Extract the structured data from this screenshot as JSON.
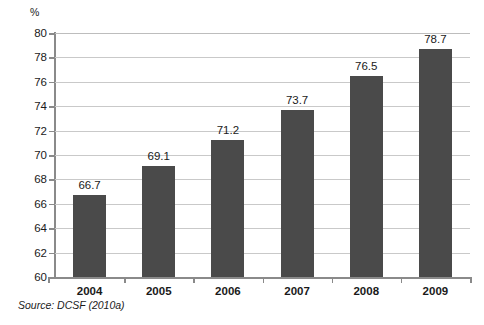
{
  "chart_data": {
    "type": "bar",
    "title": "",
    "subtitle": "",
    "xlabel": "",
    "ylabel": "%",
    "categories": [
      "2004",
      "2005",
      "2006",
      "2007",
      "2008",
      "2009"
    ],
    "values": [
      66.7,
      69.1,
      71.2,
      73.7,
      76.5,
      78.7
    ],
    "data_labels": [
      "66.7",
      "69.1",
      "71.2",
      "73.7",
      "76.5",
      "78.7"
    ],
    "ylim": [
      60,
      80
    ],
    "ytick_step": 2,
    "ytick_labels": [
      "80",
      "78",
      "76",
      "74",
      "72",
      "70",
      "68",
      "66",
      "64",
      "62",
      "60"
    ],
    "ytick_values": [
      80,
      78,
      76,
      74,
      72,
      70,
      68,
      66,
      64,
      62,
      60
    ],
    "grid": true,
    "grid_axis": "y",
    "legend": false,
    "legend_position": "none",
    "bar_color": "#4a4a4a",
    "grid_color": "#c9c9c9",
    "axis_color": "#8a8a8a",
    "background": "#ffffff"
  },
  "source": {
    "text": "Source: DCSF (2010a)"
  }
}
